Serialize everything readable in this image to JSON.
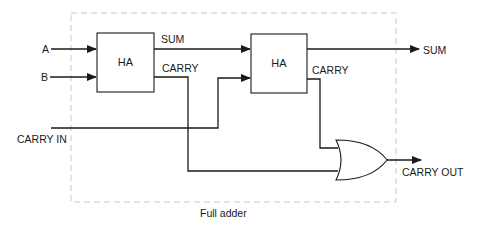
{
  "diagram": {
    "title": "Full adder",
    "inputs": {
      "a": "A",
      "b": "B",
      "carry_in": "CARRY IN"
    },
    "outputs": {
      "sum": "SUM",
      "carry_out": "CARRY OUT"
    },
    "half_adder_1": {
      "label": "HA",
      "sum_label": "SUM",
      "carry_label": "CARRY"
    },
    "half_adder_2": {
      "label": "HA",
      "carry_label": "CARRY"
    },
    "or_gate": {
      "type": "OR"
    },
    "colors": {
      "line": "#1a1a1a",
      "boundary": "#c8c8c8",
      "background": "#ffffff"
    }
  }
}
